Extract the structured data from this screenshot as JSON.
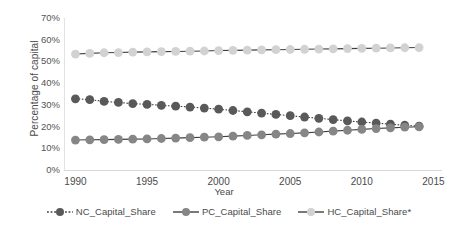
{
  "chart_data": {
    "type": "line",
    "title": "",
    "xlabel": "Year",
    "ylabel": "Percentage of capital",
    "xlim": [
      1989.2,
      2015.6
    ],
    "ylim": [
      0,
      70
    ],
    "grid": false,
    "legend_position": "bottom",
    "x_ticks": [
      "1990",
      "1995",
      "2000",
      "2005",
      "2010",
      "2015"
    ],
    "x_tick_values": [
      1990,
      1995,
      2000,
      2005,
      2010,
      2015
    ],
    "y_ticks": [
      "0%",
      "10%",
      "20%",
      "30%",
      "40%",
      "50%",
      "60%",
      "70%"
    ],
    "y_tick_values": [
      0,
      10,
      20,
      30,
      40,
      50,
      60,
      70
    ],
    "x": [
      1990,
      1991,
      1992,
      1993,
      1994,
      1995,
      1996,
      1997,
      1998,
      1999,
      2000,
      2001,
      2002,
      2003,
      2004,
      2005,
      2006,
      2007,
      2008,
      2009,
      2010,
      2011,
      2012,
      2013,
      2014
    ],
    "series": [
      {
        "name": "NC_Capital_Share",
        "color": "#595959",
        "line_style": "dotted",
        "marker": "circle",
        "values": [
          32.8,
          32.4,
          31.6,
          31.1,
          30.6,
          30.2,
          29.8,
          29.4,
          29.0,
          28.5,
          28.0,
          27.4,
          26.8,
          26.2,
          25.6,
          25.0,
          24.4,
          23.8,
          23.2,
          22.6,
          22.1,
          21.6,
          21.1,
          20.6,
          20.2
        ]
      },
      {
        "name": "PC_Capital_Share",
        "color": "#868686",
        "line_style": "solid",
        "marker": "circle",
        "values": [
          13.8,
          13.9,
          14.0,
          14.1,
          14.2,
          14.3,
          14.5,
          14.7,
          14.9,
          15.1,
          15.3,
          15.6,
          15.9,
          16.2,
          16.5,
          16.8,
          17.1,
          17.5,
          17.9,
          18.3,
          18.7,
          19.1,
          19.4,
          19.7,
          19.9
        ]
      },
      {
        "name": "HC_Capital_Share*",
        "color": "#d2d2d2",
        "line_style": "solid",
        "marker": "circle",
        "values": [
          53.4,
          53.7,
          54.0,
          54.1,
          54.3,
          54.4,
          54.5,
          54.6,
          54.7,
          54.8,
          55.0,
          55.1,
          55.2,
          55.3,
          55.4,
          55.5,
          55.6,
          55.7,
          55.8,
          55.9,
          56.0,
          56.1,
          56.2,
          56.3,
          56.4
        ]
      }
    ]
  },
  "axis": {
    "y_title": "Percentage of capital",
    "x_title": "Year"
  }
}
